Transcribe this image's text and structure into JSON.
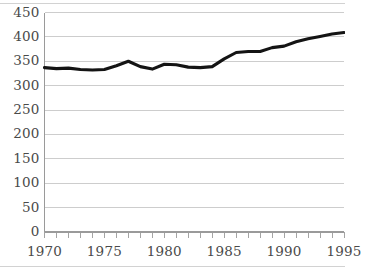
{
  "chart_data": {
    "type": "line",
    "title": "",
    "subtitle": "",
    "xlabel": "",
    "ylabel": "",
    "xlim": [
      1970,
      1995
    ],
    "ylim": [
      0,
      450
    ],
    "grid": "horizontal",
    "legend": "none",
    "y_ticks": [
      0,
      50,
      100,
      150,
      200,
      250,
      300,
      350,
      400,
      450
    ],
    "y_tick_labels": [
      "0",
      "50",
      "100",
      "150",
      "200",
      "250",
      "300",
      "350",
      "400",
      "450"
    ],
    "x_ticks": [
      1970,
      1971,
      1972,
      1973,
      1974,
      1975,
      1976,
      1977,
      1978,
      1979,
      1980,
      1981,
      1982,
      1983,
      1984,
      1985,
      1986,
      1987,
      1988,
      1989,
      1990,
      1991,
      1992,
      1993,
      1994,
      1995
    ],
    "x_tick_labels": [
      "1970",
      "1975",
      "1980",
      "1985",
      "1990",
      "1995"
    ],
    "x_labeled_ticks": [
      1970,
      1975,
      1980,
      1985,
      1990,
      1995
    ],
    "series": [
      {
        "name": "series-1",
        "color": "#141414",
        "x": [
          1970,
          1971,
          1972,
          1973,
          1974,
          1975,
          1976,
          1977,
          1978,
          1979,
          1980,
          1981,
          1982,
          1983,
          1984,
          1985,
          1986,
          1987,
          1988,
          1989,
          1990,
          1991,
          1992,
          1993,
          1994,
          1995
        ],
        "values": [
          337,
          335,
          336,
          333,
          332,
          333,
          341,
          350,
          339,
          334,
          344,
          343,
          338,
          337,
          339,
          355,
          368,
          370,
          370,
          378,
          381,
          390,
          396,
          401,
          406,
          409
        ]
      }
    ],
    "colors": {
      "line": "#141414",
      "gridline": "#c8c8c8",
      "axis": "#9a9a9a",
      "tick_label": "#4a4a4a",
      "background": "#ffffff",
      "edge_rule": "#d2d2d2"
    }
  }
}
